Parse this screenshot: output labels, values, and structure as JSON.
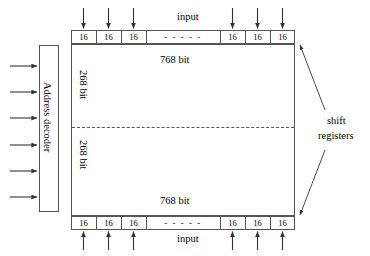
{
  "diagram": {
    "colors": {
      "line": "#555555",
      "text": "#000000",
      "background": "#ffffff"
    },
    "address_decoder": {
      "label": "Address decoder",
      "input_arrow_count": 6
    },
    "top_register": {
      "input_label": "input",
      "cells": [
        "16",
        "16",
        "16"
      ],
      "cells_right": [
        "16",
        "16",
        "16"
      ],
      "ellipsis": "-  -  -  -  -",
      "arrow_count": 6
    },
    "bottom_register": {
      "input_label": "input",
      "cells": [
        "16",
        "16",
        "16"
      ],
      "cells_right": [
        "16",
        "16",
        "16"
      ],
      "ellipsis": "-  -  -  -  -",
      "arrow_count": 6
    },
    "array": {
      "top_width_label": "768 bit",
      "bottom_width_label": "768 bit",
      "upper_height_label": "268 bit",
      "lower_height_label": "268 bit"
    },
    "annotation": {
      "line1": "shift",
      "line2": "registers"
    }
  }
}
